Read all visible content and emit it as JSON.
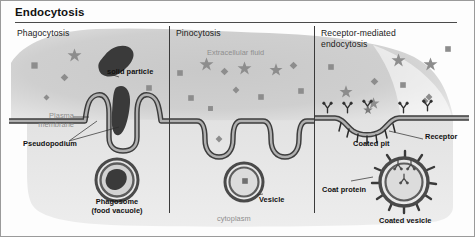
{
  "figure": {
    "title": "Endocytosis",
    "columns": [
      {
        "id": "phagocytosis",
        "header": "Phagocytosis"
      },
      {
        "id": "pinocytosis",
        "header": "Pinocytosis"
      },
      {
        "id": "receptor_mediated",
        "header": "Receptor-mediated endocytosis"
      }
    ]
  },
  "labels": {
    "solid_particle": "solid particle",
    "plasma_membrane": "Plasma\nmembrane",
    "plasma_membrane_line1": "Plasma",
    "plasma_membrane_line2": "membrane",
    "pseudopodium": "Pseudopodium",
    "phagosome_line1": "Phagosome",
    "phagosome_line2": "(food vacuole)",
    "extracellular_fluid": "Extracellular fluid",
    "vesicle": "Vesicle",
    "cytoplasm": "cytoplasm",
    "coated_pit": "Coated pit",
    "receptor": "Receptor",
    "coat_protein": "Coat protein",
    "coated_vesicle": "Coated vesicle"
  },
  "colors": {
    "background": "#fdfdfd",
    "frame_border": "#9a9a9a",
    "title_rule": "#4a4a4a",
    "divider": "#3a3a3a",
    "extracellular_blob": "#c9c9c9",
    "cytoplasm": "#e4e4e4",
    "membrane_outline": "#3d3d3d",
    "membrane_fill": "#a8a8a8",
    "particle_gray": "#8d8d8d",
    "solid_particle_dark": "#3a3a3a",
    "label_gray": "#8e8e8e",
    "label_dark": "#1b1b1b"
  },
  "glyphs": {
    "star": "star-particle",
    "square": "square-particle",
    "diamond": "diamond-particle",
    "receptor_y": "y-receptor",
    "coat_spike": "coat-protein-spike"
  }
}
